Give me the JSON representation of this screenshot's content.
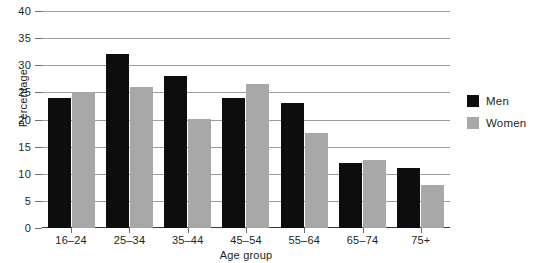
{
  "chart_data": {
    "type": "bar",
    "title": "",
    "xlabel": "Age group",
    "ylabel": "Percentage",
    "categories": [
      "16–24",
      "25–34",
      "35–44",
      "45–54",
      "55–64",
      "65–74",
      "75+"
    ],
    "series": [
      {
        "name": "Men",
        "color": "#0d0d0d",
        "values": [
          24,
          32,
          28,
          24,
          23,
          12,
          11
        ]
      },
      {
        "name": "Women",
        "color": "#a8a8a8",
        "values": [
          25,
          26,
          20,
          26.5,
          17.5,
          12.5,
          8
        ]
      }
    ],
    "ylim": [
      0,
      40
    ],
    "ytick_labels": [
      "40",
      "35",
      "30",
      "25",
      "20",
      "15",
      "10",
      "5",
      "0"
    ],
    "ytick_values": [
      40,
      35,
      30,
      25,
      20,
      15,
      10,
      5,
      0
    ],
    "grid": true,
    "legend_position": "right",
    "legend": [
      "Men",
      "Women"
    ]
  },
  "legend_entries": [
    {
      "label": "Men"
    },
    {
      "label": "Women"
    }
  ]
}
